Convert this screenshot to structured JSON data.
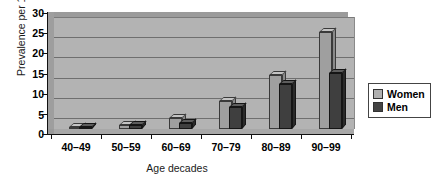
{
  "chart_data": {
    "type": "bar",
    "title": "",
    "xlabel": "Age decades",
    "ylabel": "Prevalence per 1,000",
    "categories": [
      "40–49",
      "50–59",
      "60–69",
      "70–79",
      "80–89",
      "90–99"
    ],
    "series": [
      {
        "name": "Women",
        "color": "#9f9f9f",
        "values": [
          0.3,
          1.0,
          3.0,
          7.5,
          14.5,
          26.0
        ]
      },
      {
        "name": "Men",
        "color": "#3f3f3f",
        "values": [
          0.4,
          1.2,
          1.5,
          6.0,
          12.0,
          15.0
        ]
      }
    ],
    "ylim": [
      0,
      30
    ],
    "yticks": [
      "0",
      "5",
      "10",
      "15",
      "20",
      "25",
      "30"
    ],
    "ytick_values": [
      0,
      5,
      10,
      15,
      20,
      25,
      30
    ],
    "grid": true,
    "legend_position": "right",
    "style": "3d-clustered-column",
    "plot_background": "#b3b3b3"
  },
  "legend": {
    "items": [
      {
        "label": "Women",
        "color": "#b0b0b0"
      },
      {
        "label": "Men",
        "color": "#444444"
      }
    ]
  }
}
